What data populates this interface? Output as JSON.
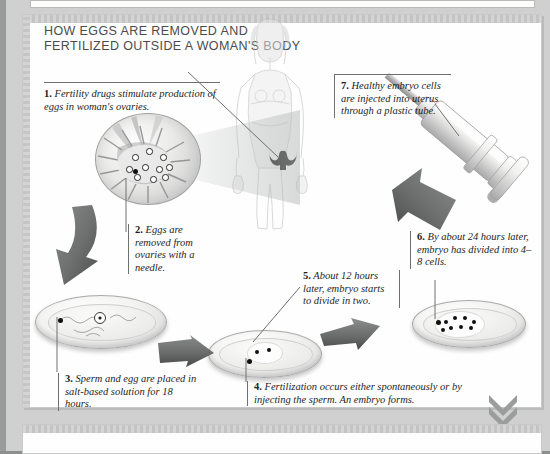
{
  "title": {
    "line1": "HOW EGGS ARE REMOVED AND",
    "line2": "FERTILIZED OUTSIDE A WOMAN'S BODY"
  },
  "steps": [
    {
      "number": "1.",
      "text": "Fertility drugs stimulate production of eggs in woman's ovaries.",
      "name": "step-1-fertility-drugs"
    },
    {
      "number": "2.",
      "text": "Eggs are removed from ovaries with a needle.",
      "name": "step-2-eggs-removed"
    },
    {
      "number": "3.",
      "text": "Sperm and egg are placed in salt-based solution for 18 hours.",
      "name": "step-3-sperm-and-egg"
    },
    {
      "number": "4.",
      "text": "Fertilization occurs either spontaneously or by injecting the sperm. An embryo forms.",
      "name": "step-4-fertilization"
    },
    {
      "number": "5.",
      "text": "About 12 hours later, embryo starts to divide in two.",
      "name": "step-5-embryo-divides"
    },
    {
      "number": "6.",
      "text": "By about 24 hours later, embryo has divided into 4–8 cells.",
      "name": "step-6-four-to-eight-cells"
    },
    {
      "number": "7.",
      "text": "Healthy embryo cells are injected into uterus through a plastic tube.",
      "name": "step-7-injected-into-uterus"
    }
  ],
  "illustrations": {
    "woman_figure": "woman-body-outline",
    "uterus": "uterus-icon",
    "ovary_magnified": "ovary-follicle-magnified",
    "syringe": "syringe-icon",
    "dish_sperm_egg": "petri-dish-sperm-and-egg",
    "dish_two_cell": "petri-dish-two-cell-embryo",
    "dish_multi_cell": "petri-dish-multi-cell-embryo",
    "scroll_hint": "double-chevron-down-icon"
  },
  "colors": {
    "page_background": "#9a9c9b",
    "panel_background": "#fefefe",
    "title_text": "#4a4c4b",
    "body_text": "#1d1f1e",
    "rule": "#6e706f",
    "arrow": "#6f7170"
  }
}
